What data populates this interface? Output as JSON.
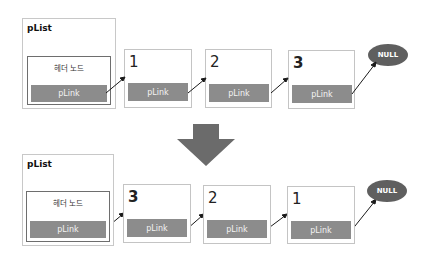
{
  "before": {
    "list_label": "pList",
    "header_label": "헤더 노드",
    "header_link": "pLink",
    "nodes": [
      {
        "value": "1",
        "link": "pLink",
        "bold": false
      },
      {
        "value": "2",
        "link": "pLink",
        "bold": false
      },
      {
        "value": "3",
        "link": "pLink",
        "bold": true
      }
    ],
    "terminal": "NULL"
  },
  "transition_arrow": "down-arrow",
  "after": {
    "list_label": "pList",
    "header_label": "헤더 노드",
    "header_link": "pLink",
    "nodes": [
      {
        "value": "3",
        "link": "pLink",
        "bold": true
      },
      {
        "value": "2",
        "link": "pLink",
        "bold": false
      },
      {
        "value": "1",
        "link": "pLink",
        "bold": false
      }
    ],
    "terminal": "NULL"
  },
  "colors": {
    "link_bar": "#8c8c8c",
    "null_ellipse": "#5f5f5f",
    "arrow": "#6b6b6b",
    "box_border": "#c4c4c4"
  }
}
